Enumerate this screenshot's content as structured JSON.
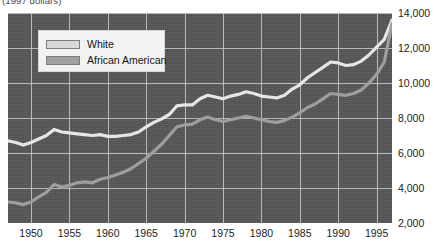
{
  "caption": "(1997 dollars)",
  "legend": {
    "position": "top-left-inside",
    "entries": [
      {
        "label": "White",
        "color": "#d9d9d9",
        "key": "white"
      },
      {
        "label": "African American",
        "color": "#a0a0a0",
        "key": "african_american"
      }
    ]
  },
  "axes": {
    "y_ticks": [
      "2,000",
      "4,000",
      "6,000",
      "8,000",
      "10,000",
      "12,000",
      "14,000"
    ],
    "x_ticks": [
      "1950",
      "1955",
      "1960",
      "1965",
      "1970",
      "1975",
      "1980",
      "1985",
      "1990",
      "1995"
    ]
  },
  "style": {
    "plot_background": "#565656",
    "grid_color": "#c9c9c9",
    "white_line": "#e6e6e6",
    "african_american_line": "#9e9e9e",
    "page_background": "#ffffff",
    "text_color": "#1a1a1a"
  },
  "chart_data": {
    "type": "line",
    "title": "",
    "subtitle": "(1997 dollars)",
    "xlabel": "",
    "ylabel": "",
    "xlim": [
      1947,
      1997
    ],
    "ylim": [
      2000,
      14000
    ],
    "grid": true,
    "legend_position": "upper left",
    "x": [
      1947,
      1948,
      1949,
      1950,
      1951,
      1952,
      1953,
      1954,
      1955,
      1956,
      1957,
      1958,
      1959,
      1960,
      1961,
      1962,
      1963,
      1964,
      1965,
      1966,
      1967,
      1968,
      1969,
      1970,
      1971,
      1972,
      1973,
      1974,
      1975,
      1976,
      1977,
      1978,
      1979,
      1980,
      1981,
      1982,
      1983,
      1984,
      1985,
      1986,
      1987,
      1988,
      1989,
      1990,
      1991,
      1992,
      1993,
      1994,
      1995,
      1996,
      1997
    ],
    "series": [
      {
        "name": "White",
        "color": "#e6e6e6",
        "values": [
          6700,
          6600,
          6450,
          6600,
          6800,
          7000,
          7350,
          7200,
          7150,
          7100,
          7050,
          7000,
          7050,
          6950,
          6950,
          7000,
          7050,
          7200,
          7500,
          7750,
          7950,
          8200,
          8700,
          8750,
          8750,
          9100,
          9300,
          9200,
          9100,
          9250,
          9350,
          9500,
          9400,
          9250,
          9200,
          9150,
          9300,
          9650,
          9900,
          10300,
          10600,
          10900,
          11200,
          11150,
          11000,
          11050,
          11250,
          11600,
          12050,
          12500,
          13600
        ]
      },
      {
        "name": "African American",
        "color": "#9e9e9e",
        "values": [
          3200,
          3150,
          3050,
          3200,
          3500,
          3750,
          4200,
          4050,
          4150,
          4300,
          4350,
          4300,
          4500,
          4600,
          4750,
          4900,
          5100,
          5400,
          5700,
          6100,
          6500,
          7000,
          7500,
          7600,
          7650,
          7900,
          8050,
          7900,
          7800,
          7900,
          8000,
          8100,
          8000,
          7900,
          7800,
          7750,
          7850,
          8050,
          8300,
          8600,
          8800,
          9100,
          9400,
          9350,
          9300,
          9400,
          9600,
          10000,
          10500,
          11200,
          13400
        ]
      }
    ]
  }
}
